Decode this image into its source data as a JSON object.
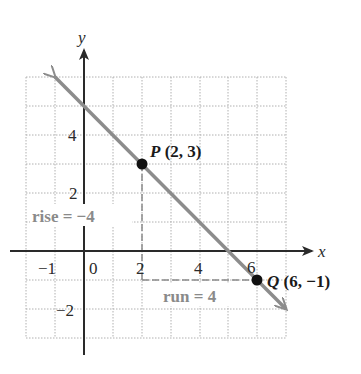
{
  "diagram": {
    "type": "coordinate-plane-slope",
    "axes": {
      "x_label": "x",
      "y_label": "y",
      "x_range": [
        -2,
        7
      ],
      "y_range": [
        -3,
        6
      ],
      "x_ticks": [
        {
          "value": -1,
          "label": "−1"
        },
        {
          "value": 0,
          "label": "0"
        },
        {
          "value": 2,
          "label": "2"
        },
        {
          "value": 4,
          "label": "4"
        },
        {
          "value": 6,
          "label": "6"
        }
      ],
      "y_ticks": [
        {
          "value": 4,
          "label": "4"
        },
        {
          "value": 2,
          "label": "2"
        },
        {
          "value": -2,
          "label": "−2"
        }
      ],
      "grid": true
    },
    "line": {
      "description": "line through P and Q, arrows both ends",
      "slope": -1,
      "from": [
        -1,
        6
      ],
      "to": [
        7,
        -2
      ],
      "color": "#8c8c8c"
    },
    "points": [
      {
        "name": "P",
        "coords": "(2, 3)",
        "x": 2,
        "y": 3
      },
      {
        "name": "Q",
        "coords": "(6, −1)",
        "x": 6,
        "y": -1
      }
    ],
    "annotations": {
      "rise": "rise = −4",
      "run": "run = 4"
    },
    "colors": {
      "axes": "#2a2a2a",
      "line": "#8c8c8c",
      "grid": "#b0b0b0",
      "annotation": "#8a8a8a",
      "points": "#111111"
    }
  }
}
